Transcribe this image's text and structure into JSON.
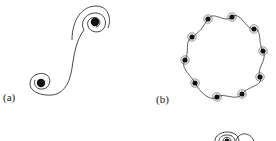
{
  "figure": {
    "panels": [
      {
        "id": "a",
        "label": "(a)",
        "description": "Two co-rotating point vortices connected by an S-shaped spiral filament",
        "vortices": [
          {
            "cx": 95,
            "cy": 22
          },
          {
            "cx": 41,
            "cy": 83
          }
        ]
      },
      {
        "id": "b",
        "label": "(b)",
        "description": "Ring of ten spiral vortices connected by wavy filaments",
        "vortex_count": 10,
        "vortices": [
          {
            "cx": 208,
            "cy": 19
          },
          {
            "cx": 232,
            "cy": 17
          },
          {
            "cx": 254,
            "cy": 29
          },
          {
            "cx": 263,
            "cy": 51
          },
          {
            "cx": 260,
            "cy": 77
          },
          {
            "cx": 242,
            "cy": 94
          },
          {
            "cx": 217,
            "cy": 97
          },
          {
            "cx": 195,
            "cy": 83
          },
          {
            "cx": 185,
            "cy": 60
          },
          {
            "cx": 192,
            "cy": 37
          }
        ]
      },
      {
        "id": "c",
        "label": "",
        "description": "Partially visible nested spiral curves (cropped at bottom edge)"
      }
    ],
    "colors": {
      "line": "#333333",
      "core": "#111111",
      "background": "#ffffff"
    }
  }
}
